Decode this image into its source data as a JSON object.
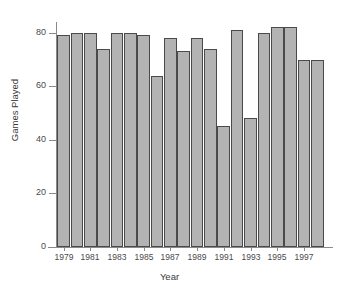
{
  "chart_data": {
    "type": "bar",
    "title": "",
    "xlabel": "Year",
    "ylabel": "Games Played",
    "ylim": [
      0,
      84
    ],
    "yticks": [
      0,
      20,
      40,
      60,
      80
    ],
    "ytick_labels": [
      "0",
      "20",
      "40",
      "60",
      "80"
    ],
    "grid": false,
    "legend": "none",
    "bar_color": "#b3b3b3",
    "bar_edge_color": "#4a4a4a",
    "axis_color": "#8a8a8a",
    "categories": [
      "1979",
      "1980",
      "1981",
      "1982",
      "1983",
      "1984",
      "1985",
      "1986",
      "1987",
      "1988",
      "1989",
      "1990",
      "1991",
      "1992",
      "1993",
      "1994",
      "1995",
      "1996",
      "1997",
      "1998"
    ],
    "values": [
      79,
      80,
      80,
      74,
      80,
      80,
      79,
      64,
      78,
      73,
      78,
      74,
      45,
      81,
      48,
      80,
      82,
      82,
      70,
      70
    ],
    "xtick_labels": [
      "1979",
      "1981",
      "1983",
      "1985",
      "1987",
      "1989",
      "1991",
      "1993",
      "1995",
      "1997"
    ],
    "xtick_categories": [
      "1979",
      "1981",
      "1983",
      "1985",
      "1987",
      "1989",
      "1991",
      "1993",
      "1995",
      "1997"
    ]
  }
}
